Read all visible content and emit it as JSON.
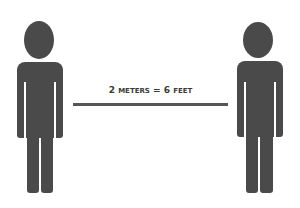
{
  "diagram": {
    "label": "2 METERS = 6 FEET",
    "label_parts": {
      "num1": "2",
      "unit1": "METERS",
      "eq": "=",
      "num2": "6",
      "unit2": "FEET"
    },
    "figures": [
      {
        "name": "person-left"
      },
      {
        "name": "person-right"
      }
    ],
    "colors": {
      "figure": "#4a4a4a",
      "line": "#555555",
      "text": "#3a3a3a",
      "background": "#ffffff"
    }
  }
}
